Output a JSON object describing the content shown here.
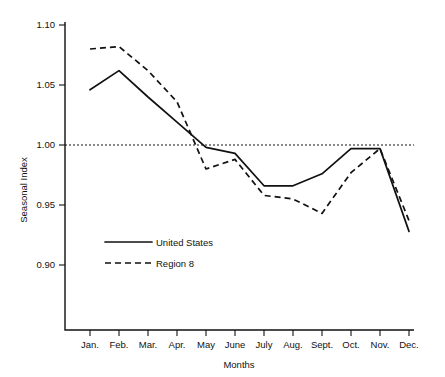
{
  "chart_data": {
    "type": "line",
    "title": "",
    "xlabel": "Months",
    "ylabel": "Seasonal Index",
    "categories": [
      "Jan.",
      "Feb.",
      "Mar.",
      "Apr.",
      "May",
      "June",
      "July",
      "Aug.",
      "Sept.",
      "Oct.",
      "Nov.",
      "Dec."
    ],
    "ylim": [
      0.9,
      1.1
    ],
    "yticks": [
      0.9,
      0.95,
      1.0,
      1.05,
      1.1
    ],
    "ytick_labels": [
      "0.90",
      "0.95",
      "1.00",
      "1.05",
      "1.10"
    ],
    "grid": false,
    "legend_position": "inside-lower-left",
    "reference_line": {
      "value": 1.0,
      "style": "dotted",
      "label": ""
    },
    "series": [
      {
        "name": "United States",
        "style": "solid",
        "color": "#111111",
        "values": [
          1.046,
          1.062,
          1.04,
          1.019,
          0.998,
          0.993,
          0.966,
          0.966,
          0.976,
          0.997,
          0.997,
          0.928
        ]
      },
      {
        "name": "Region 8",
        "style": "dashed",
        "color": "#111111",
        "values": [
          1.08,
          1.082,
          1.062,
          1.036,
          0.98,
          0.988,
          0.958,
          0.955,
          0.943,
          0.977,
          0.997,
          0.937
        ]
      }
    ]
  },
  "axes": {
    "y_axis_title": "Seasonal Index",
    "x_axis_title": "Months"
  },
  "legend": {
    "entries": [
      {
        "label": "United States",
        "style": "solid"
      },
      {
        "label": "Region 8",
        "style": "dashed"
      }
    ]
  }
}
